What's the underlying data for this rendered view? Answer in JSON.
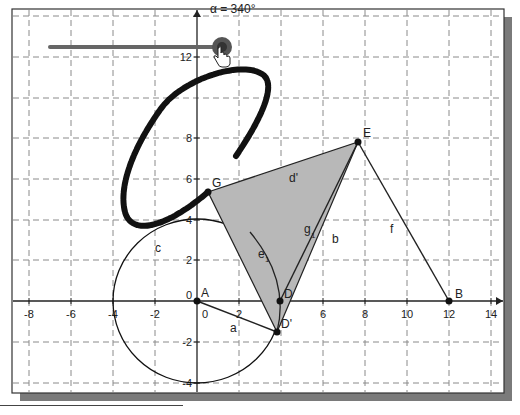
{
  "app": {
    "view": "graphics-view"
  },
  "slider": {
    "label": "α = 340°",
    "name": "α",
    "value": 340,
    "unit": "°"
  },
  "axes": {
    "x_ticks": [
      "-8",
      "-6",
      "-4",
      "-2",
      "0",
      "2",
      "4",
      "6",
      "8",
      "10",
      "12",
      "14"
    ],
    "x_labels_visible": [
      "-8",
      "-6",
      "-4",
      "-2",
      "0",
      "2",
      "6",
      "8",
      "10",
      "12",
      "14"
    ],
    "y_labels_visible": [
      "12",
      "8",
      "6",
      "4",
      "2",
      "0",
      "-2",
      "-4"
    ],
    "origin_label": "0",
    "grid": "dashed"
  },
  "points": [
    {
      "name": "A",
      "x": 0,
      "y": 0
    },
    {
      "name": "B",
      "x": 12,
      "y": 0
    },
    {
      "name": "D",
      "x": 3.9,
      "y": 0
    },
    {
      "name": "D'",
      "x": 3.8,
      "y": -1.5
    },
    {
      "name": "E",
      "x": 7.6,
      "y": 7.8
    },
    {
      "name": "G",
      "x": 0.5,
      "y": 5.4
    }
  ],
  "labels": {
    "A": "A",
    "B": "B",
    "D": "D",
    "D_prime": "D'",
    "E": "E",
    "G": "G",
    "segment_a": "a",
    "segment_b": "b",
    "segment_f": "f",
    "segment_g1": "g",
    "segment_g1_sub": "1",
    "polygon_d_prime": "d'",
    "circle_c": "c",
    "arc_e1": "e",
    "arc_e1_sub": "1"
  },
  "colors": {
    "grid": "#888888",
    "axes": "#222222",
    "polygon_fill": "#b8b8b8",
    "trace": "#111111",
    "slider_track": "#666666",
    "slider_knob": "#555555",
    "frame_shadow": "#777777"
  }
}
